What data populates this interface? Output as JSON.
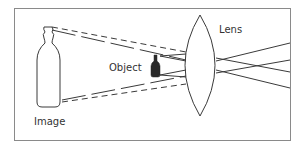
{
  "diagram": {
    "labels": {
      "lens": "Lens",
      "object": "Object",
      "image": "Image"
    },
    "colors": {
      "frame": "#8a8a8a",
      "line": "#3a3a3a",
      "object_fill": "#2a2a2a",
      "background": "#ffffff"
    }
  }
}
